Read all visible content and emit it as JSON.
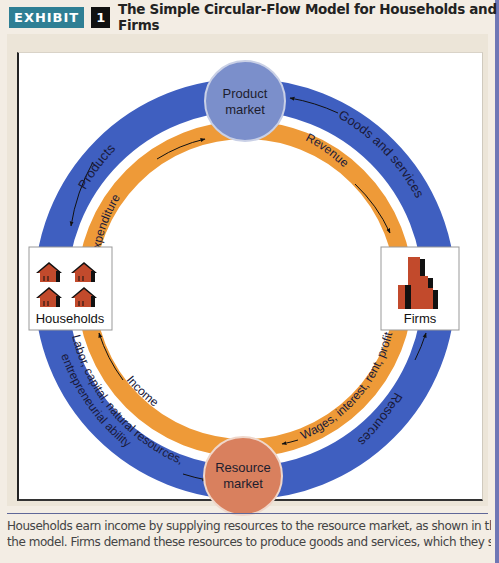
{
  "header": {
    "exhibit_tag": "EXHIBIT",
    "exhibit_number": "1",
    "title": "The Simple Circular-Flow Model for Households and Firms"
  },
  "diagram": {
    "nodes": {
      "product_market": {
        "line1": "Product",
        "line2": "market",
        "color": "#7b8fcb"
      },
      "resource_market": {
        "line1": "Resource",
        "line2": "market",
        "color": "#d9805e"
      },
      "households": {
        "label": "Households",
        "icon": "houses-icon"
      },
      "firms": {
        "label": "Firms",
        "icon": "buildings-icon"
      }
    },
    "outer_ring": {
      "color": "#3f5fc0",
      "labels": {
        "products": "Products",
        "goods_and_services": "Goods and services",
        "resources": "Resources",
        "factors_line1": "Labor, capital, natural resources,",
        "factors_line2": "entrepreneurial ability"
      }
    },
    "inner_ring": {
      "color": "#ee9a38",
      "labels": {
        "expenditure": "Expenditure",
        "revenue": "Revenue",
        "wages": "Wages, interest, rent, profit",
        "income": "Income"
      }
    }
  },
  "caption": {
    "line1": "Households earn income by supplying resources to the resource market, as shown in the lower portion of",
    "line2": "the model. Firms demand these resources to produce goods and services, which they supply to the product"
  }
}
